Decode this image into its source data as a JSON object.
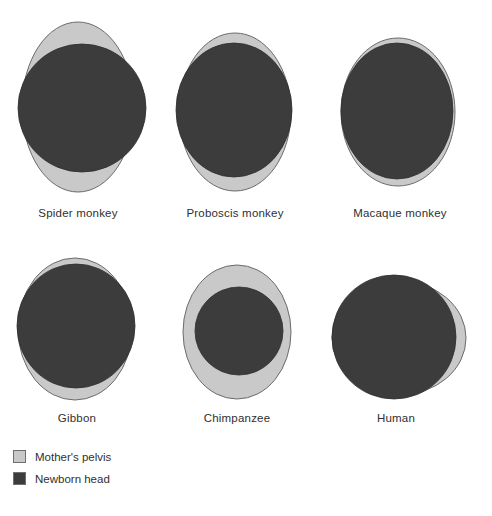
{
  "figure": {
    "title": "",
    "colors": {
      "pelvis_fill": "#c9c9c9",
      "pelvis_stroke": "#6b6b6b",
      "head_fill": "#3c3c3c",
      "head_stroke": "#2e2e2e",
      "background": "#ffffff"
    },
    "panels": [
      {
        "id": "spider-monkey",
        "label": "Spider monkey",
        "pelvis": {
          "cx": 78,
          "cy": 107,
          "rx": 56,
          "ry": 85
        },
        "head": {
          "cx": 82,
          "cy": 108,
          "rx": 64,
          "ry": 64
        },
        "caption": {
          "x": 78,
          "y": 207
        }
      },
      {
        "id": "proboscis-monkey",
        "label": "Proboscis monkey",
        "pelvis": {
          "cx": 235,
          "cy": 112,
          "rx": 56,
          "ry": 79
        },
        "head": {
          "cx": 234,
          "cy": 110,
          "rx": 58,
          "ry": 67
        },
        "caption": {
          "x": 235,
          "y": 207
        }
      },
      {
        "id": "macaque-monkey",
        "label": "Macaque monkey",
        "pelvis": {
          "cx": 398,
          "cy": 112,
          "rx": 57,
          "ry": 74
        },
        "head": {
          "cx": 397,
          "cy": 111,
          "rx": 56,
          "ry": 68
        },
        "caption": {
          "x": 400,
          "y": 207
        }
      },
      {
        "id": "gibbon",
        "label": "Gibbon",
        "pelvis": {
          "cx": 75,
          "cy": 329,
          "rx": 57,
          "ry": 71
        },
        "head": {
          "cx": 76,
          "cy": 326,
          "rx": 59,
          "ry": 62
        },
        "caption": {
          "x": 77,
          "y": 412
        }
      },
      {
        "id": "chimpanzee",
        "label": "Chimpanzee",
        "pelvis": {
          "cx": 237,
          "cy": 332,
          "rx": 54,
          "ry": 67
        },
        "head": {
          "cx": 239,
          "cy": 331,
          "rx": 44,
          "ry": 44
        },
        "caption": {
          "x": 237,
          "y": 412
        }
      },
      {
        "id": "human",
        "label": "Human",
        "pelvis": {
          "cx": 399,
          "cy": 338,
          "rx": 67,
          "ry": 57
        },
        "head": {
          "cx": 394,
          "cy": 337,
          "rx": 62,
          "ry": 62
        },
        "caption": {
          "x": 396,
          "y": 412
        }
      }
    ]
  },
  "legend": {
    "items": [
      {
        "label": "Mother's pelvis",
        "color": "#c9c9c9",
        "swatch_name": "legend-swatch-pelvis"
      },
      {
        "label": "Newborn head",
        "color": "#3c3c3c",
        "swatch_name": "legend-swatch-head"
      }
    ]
  }
}
